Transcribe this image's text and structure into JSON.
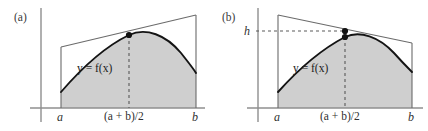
{
  "figure": {
    "panels": [
      {
        "id": "a",
        "label": "(a)",
        "x_axis_labels": {
          "left": "a",
          "mid": "(a + b)/2",
          "right": "b"
        },
        "curve_label": "y = f(x)",
        "height_label": null,
        "description": "Tangent line trapezoid at the midpoint; shaded region under the curve from a to b",
        "geometry": {
          "axis_y": 108,
          "y_axis_x": 41,
          "x_left": 61,
          "x_mid": 129,
          "x_right": 196,
          "trapezoid_top_left_y": 47,
          "trapezoid_top_right_y": 15,
          "curve_left_y": 92,
          "curve_mid_y": 35,
          "curve_peak_x": 152,
          "curve_peak_y": 31,
          "curve_right_y": 73,
          "dots": [
            {
              "x": 129,
              "y": 35
            }
          ]
        }
      },
      {
        "id": "b",
        "label": "(b)",
        "x_axis_labels": {
          "left": "a",
          "mid": "(a + b)/2",
          "right": "b"
        },
        "curve_label": "y = f(x)",
        "height_label": "h",
        "description": "Trapezoid with slanted top through the midpoint height h; dashed horizontal line marks h",
        "geometry": {
          "axis_y": 108,
          "y_axis_x": 258,
          "x_left": 278,
          "x_mid": 345,
          "x_right": 412,
          "trapezoid_top_left_y": 15,
          "trapezoid_top_right_y": 43,
          "h_line_y": 31,
          "curve_left_y": 92,
          "curve_mid_y": 37,
          "curve_peak_x": 368,
          "curve_peak_y": 33,
          "curve_right_y": 72,
          "dots": [
            {
              "x": 345,
              "y": 31
            },
            {
              "x": 345,
              "y": 37
            }
          ]
        }
      }
    ],
    "colors": {
      "shaded_region": "#cfcfcf",
      "curve": "#1a1a1a",
      "thin_line": "#6b6b6b",
      "axis": "#8a8a8a",
      "dashed": "#5a5a5a",
      "dot": "#111111",
      "background": "#ffffff"
    }
  }
}
